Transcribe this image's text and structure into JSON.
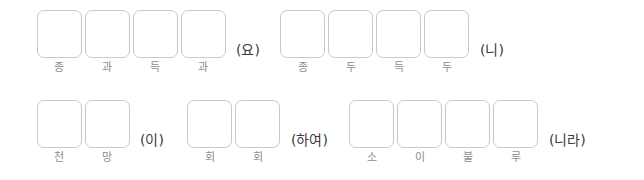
{
  "worksheet": {
    "background_color": "#ffffff",
    "box_border_color": "#c9c9c9",
    "label_color": "#8d8d8d",
    "suffix_color": "#3a3a3a",
    "rows": [
      {
        "groups": [
          {
            "cells": [
              "종",
              "과",
              "득",
              "과"
            ],
            "suffix": "(요)"
          },
          {
            "cells": [
              "종",
              "두",
              "득",
              "두"
            ],
            "suffix": "(니)"
          }
        ]
      },
      {
        "groups": [
          {
            "cells": [
              "천",
              "망"
            ],
            "suffix": "(이)"
          },
          {
            "cells": [
              "회",
              "회"
            ],
            "suffix": "(하여)"
          },
          {
            "cells": [
              "소",
              "이",
              "불",
              "루"
            ],
            "suffix": "(니라)"
          }
        ]
      }
    ]
  }
}
